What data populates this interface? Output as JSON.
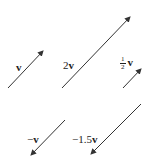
{
  "diagram": {
    "stroke_color": "#333333",
    "vectors": [
      {
        "id": "v",
        "label_coef": "",
        "label_vec": "v",
        "tail": [
          8,
          88
        ],
        "head": [
          43,
          51
        ]
      },
      {
        "id": "2v",
        "label_coef": "2",
        "label_vec": "v",
        "tail": [
          62,
          88
        ],
        "head": [
          130,
          17
        ]
      },
      {
        "id": "half-v",
        "label_num": "1",
        "label_den": "2",
        "label_vec": "v",
        "tail": [
          123,
          88
        ],
        "head": [
          141,
          69
        ]
      },
      {
        "id": "neg-v",
        "label_coef": "−",
        "label_vec": "v",
        "tail": [
          65,
          120
        ],
        "head": [
          31,
          155
        ]
      },
      {
        "id": "neg-1.5v",
        "label_coef": "−1.5",
        "label_vec": "v",
        "tail": [
          141,
          104
        ],
        "head": [
          91,
          154
        ]
      }
    ]
  }
}
